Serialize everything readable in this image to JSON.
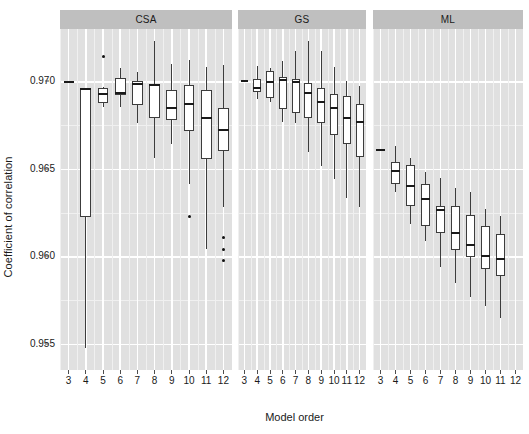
{
  "chart_data": {
    "type": "boxplot",
    "title": "",
    "xlabel": "Model order",
    "ylabel": "Coefficient of correlation",
    "ylim": [
      0.9535,
      0.973
    ],
    "yticks": [
      0.97,
      0.965,
      0.96,
      0.955
    ],
    "ytick_labels": [
      "0.970",
      "0.965",
      "0.960",
      "0.955"
    ],
    "categories": [
      3,
      4,
      5,
      6,
      7,
      8,
      9,
      10,
      11,
      12
    ],
    "xtick_labels": [
      "3",
      "4",
      "5",
      "6",
      "7",
      "8",
      "9",
      "10",
      "11",
      "12"
    ],
    "grid": true,
    "legend": "none",
    "facet_labels": [
      "CSA",
      "GS",
      "ML"
    ],
    "panels": [
      {
        "name": "CSA",
        "boxes": [
          {
            "x": 3,
            "lower_whisker": 0.96998,
            "q1": 0.96998,
            "median": 0.96998,
            "q3": 0.96998,
            "upper_whisker": 0.96998,
            "degenerate": true,
            "outliers": []
          },
          {
            "x": 4,
            "lower_whisker": 0.95475,
            "q1": 0.96225,
            "median": 0.96955,
            "q3": 0.96958,
            "upper_whisker": 0.9696,
            "outliers": []
          },
          {
            "x": 5,
            "lower_whisker": 0.96855,
            "q1": 0.96875,
            "median": 0.9693,
            "q3": 0.96965,
            "upper_whisker": 0.9697,
            "outliers": [
              0.97145
            ]
          },
          {
            "x": 6,
            "lower_whisker": 0.96855,
            "q1": 0.96925,
            "median": 0.96935,
            "q3": 0.9702,
            "upper_whisker": 0.97075,
            "outliers": []
          },
          {
            "x": 7,
            "lower_whisker": 0.9676,
            "q1": 0.96865,
            "median": 0.96985,
            "q3": 0.97005,
            "upper_whisker": 0.97055,
            "outliers": []
          },
          {
            "x": 8,
            "lower_whisker": 0.9656,
            "q1": 0.9679,
            "median": 0.9698,
            "q3": 0.96985,
            "upper_whisker": 0.9723,
            "outliers": []
          },
          {
            "x": 9,
            "lower_whisker": 0.96645,
            "q1": 0.9678,
            "median": 0.9685,
            "q3": 0.9695,
            "upper_whisker": 0.971,
            "outliers": []
          },
          {
            "x": 10,
            "lower_whisker": 0.96415,
            "q1": 0.96715,
            "median": 0.9687,
            "q3": 0.9698,
            "upper_whisker": 0.9712,
            "outliers": [
              0.96225
            ]
          },
          {
            "x": 11,
            "lower_whisker": 0.9604,
            "q1": 0.96555,
            "median": 0.9679,
            "q3": 0.9695,
            "upper_whisker": 0.9708,
            "outliers": []
          },
          {
            "x": 12,
            "lower_whisker": 0.9628,
            "q1": 0.96605,
            "median": 0.9672,
            "q3": 0.9685,
            "upper_whisker": 0.97095,
            "outliers": [
              0.9611,
              0.9604,
              0.95975
            ]
          }
        ]
      },
      {
        "name": "GS",
        "boxes": [
          {
            "x": 3,
            "lower_whisker": 0.97,
            "q1": 0.97,
            "median": 0.97,
            "q3": 0.97,
            "upper_whisker": 0.97,
            "degenerate": true,
            "outliers": []
          },
          {
            "x": 4,
            "lower_whisker": 0.969,
            "q1": 0.9694,
            "median": 0.9696,
            "q3": 0.97015,
            "upper_whisker": 0.9709,
            "outliers": []
          },
          {
            "x": 5,
            "lower_whisker": 0.96885,
            "q1": 0.96905,
            "median": 0.96995,
            "q3": 0.9706,
            "upper_whisker": 0.97075,
            "outliers": []
          },
          {
            "x": 6,
            "lower_whisker": 0.9677,
            "q1": 0.9684,
            "median": 0.9701,
            "q3": 0.97025,
            "upper_whisker": 0.97115,
            "outliers": []
          },
          {
            "x": 7,
            "lower_whisker": 0.9676,
            "q1": 0.9682,
            "median": 0.96995,
            "q3": 0.97015,
            "upper_whisker": 0.97175,
            "outliers": []
          },
          {
            "x": 8,
            "lower_whisker": 0.96595,
            "q1": 0.9679,
            "median": 0.96935,
            "q3": 0.9699,
            "upper_whisker": 0.9723,
            "outliers": []
          },
          {
            "x": 9,
            "lower_whisker": 0.96515,
            "q1": 0.9676,
            "median": 0.9688,
            "q3": 0.96965,
            "upper_whisker": 0.97175,
            "outliers": []
          },
          {
            "x": 10,
            "lower_whisker": 0.9644,
            "q1": 0.96695,
            "median": 0.9685,
            "q3": 0.9693,
            "upper_whisker": 0.97085,
            "outliers": []
          },
          {
            "x": 11,
            "lower_whisker": 0.96335,
            "q1": 0.9664,
            "median": 0.9679,
            "q3": 0.96915,
            "upper_whisker": 0.97,
            "outliers": []
          },
          {
            "x": 12,
            "lower_whisker": 0.9628,
            "q1": 0.9657,
            "median": 0.9677,
            "q3": 0.9687,
            "upper_whisker": 0.96975,
            "outliers": []
          }
        ]
      },
      {
        "name": "ML",
        "boxes": [
          {
            "x": 3,
            "lower_whisker": 0.9661,
            "q1": 0.9661,
            "median": 0.9661,
            "q3": 0.9661,
            "upper_whisker": 0.9661,
            "degenerate": true,
            "outliers": []
          },
          {
            "x": 4,
            "lower_whisker": 0.9637,
            "q1": 0.96415,
            "median": 0.9649,
            "q3": 0.9654,
            "upper_whisker": 0.9663,
            "outliers": []
          },
          {
            "x": 5,
            "lower_whisker": 0.96185,
            "q1": 0.9629,
            "median": 0.96405,
            "q3": 0.9652,
            "upper_whisker": 0.9656,
            "outliers": []
          },
          {
            "x": 6,
            "lower_whisker": 0.96085,
            "q1": 0.96175,
            "median": 0.9633,
            "q3": 0.96415,
            "upper_whisker": 0.96485,
            "outliers": []
          },
          {
            "x": 7,
            "lower_whisker": 0.9594,
            "q1": 0.96135,
            "median": 0.96265,
            "q3": 0.9629,
            "upper_whisker": 0.9645,
            "outliers": []
          },
          {
            "x": 8,
            "lower_whisker": 0.9585,
            "q1": 0.96035,
            "median": 0.96135,
            "q3": 0.96285,
            "upper_whisker": 0.9639,
            "outliers": []
          },
          {
            "x": 9,
            "lower_whisker": 0.9577,
            "q1": 0.95995,
            "median": 0.96065,
            "q3": 0.96235,
            "upper_whisker": 0.9637,
            "outliers": []
          },
          {
            "x": 10,
            "lower_whisker": 0.95715,
            "q1": 0.9593,
            "median": 0.96,
            "q3": 0.96175,
            "upper_whisker": 0.9627,
            "outliers": []
          },
          {
            "x": 11,
            "lower_whisker": 0.9565,
            "q1": 0.9589,
            "median": 0.95985,
            "q3": 0.9613,
            "upper_whisker": 0.9623,
            "outliers": []
          },
          {
            "x": 12,
            "lower_whisker": null,
            "q1": null,
            "median": null,
            "q3": null,
            "upper_whisker": null,
            "empty": true,
            "outliers": []
          }
        ]
      }
    ],
    "colors": {
      "panel_background": "#e0e0e0",
      "strip_background": "#bfbfbf",
      "major_grid": "#ffffff",
      "minor_grid": "#f0f0f0",
      "box_fill": "#ffffff",
      "box_line": "#3c3c3c",
      "median_line": "#1a1a1a",
      "outlier": "#111111",
      "text": "#1a1a1a"
    }
  }
}
